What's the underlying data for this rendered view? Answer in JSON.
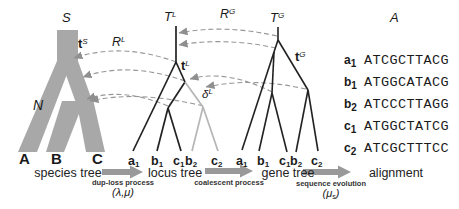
{
  "colors": {
    "species_band": "#a8a8a8",
    "tree_line": "#222222",
    "daughter_line": "#b5b5b5",
    "map_line": "#979797",
    "arrowhead": "#8f8f8f",
    "process_arrow": "#999999"
  },
  "species_tree": {
    "root_label": "S",
    "branch_time": {
      "base": "t",
      "sup": "S"
    },
    "population_label": "N",
    "leaves": [
      "A",
      "B",
      "C"
    ],
    "caption": "species tree"
  },
  "locus_tree": {
    "tree_label": {
      "base": "T",
      "sup": "L"
    },
    "branch_time": {
      "base": "t",
      "sup": "L"
    },
    "duplication_label": {
      "base": "δ",
      "sup": "L"
    },
    "recon_label": {
      "base": "R",
      "sup": "L"
    },
    "leaves": [
      {
        "base": "a",
        "sub": "1"
      },
      {
        "base": "b",
        "sub": "1"
      },
      {
        "base": "c",
        "sub": "1"
      },
      {
        "base": "b",
        "sub": "2"
      },
      {
        "base": "c",
        "sub": "2"
      }
    ],
    "caption": "locus tree"
  },
  "gene_tree": {
    "tree_label": {
      "base": "T",
      "sup": "G"
    },
    "branch_time": {
      "base": "t",
      "sup": "G"
    },
    "recon_label": {
      "base": "R",
      "sup": "G"
    },
    "leaves": [
      {
        "base": "a",
        "sub": "1"
      },
      {
        "base": "b",
        "sub": "1"
      },
      {
        "base": "c",
        "sub": "1"
      },
      {
        "base": "b",
        "sub": "2"
      },
      {
        "base": "c",
        "sub": "2"
      }
    ],
    "caption": "gene tree"
  },
  "processes": {
    "dup_loss": {
      "label": "dup-loss process",
      "params_pre": "(λ,μ)",
      "params_sub": "",
      "params_post": ""
    },
    "coalescent": {
      "label": "coalescent process"
    },
    "seq_evolution": {
      "label": "sequence evolution",
      "params_pre": "(μ",
      "params_sub": "s",
      "params_post": ")"
    }
  },
  "alignment": {
    "header": "A",
    "caption": "alignment",
    "rows": [
      {
        "label": {
          "base": "a",
          "sub": "1"
        },
        "seq": "ATCGCTTACG"
      },
      {
        "label": {
          "base": "b",
          "sub": "1"
        },
        "seq": "ATGGCATACG"
      },
      {
        "label": {
          "base": "b",
          "sub": "2"
        },
        "seq": "ATCCCTTAGG"
      },
      {
        "label": {
          "base": "c",
          "sub": "1"
        },
        "seq": "ATGGCTATCG"
      },
      {
        "label": {
          "base": "c",
          "sub": "2"
        },
        "seq": "ATCGCTTTCC"
      }
    ]
  }
}
